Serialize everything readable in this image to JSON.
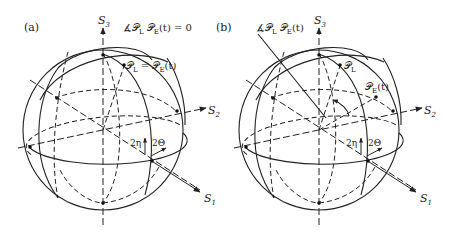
{
  "figure": {
    "panels": [
      {
        "label": "(a)",
        "axes": {
          "s1": "S",
          "s1_sub": "1",
          "s2": "S",
          "s2_sub": "2",
          "s3": "S",
          "s3_sub": "3"
        },
        "annotation": {
          "prefix": "∡𝒫",
          "sub1": "L",
          "mid": " 𝒫",
          "sub2": "E",
          "suffix": "(t) = 0"
        },
        "point_label": {
          "p1": "𝒫",
          "p1_sub": "L",
          "eq": " = 𝒫",
          "p2_sub": "E",
          "suffix": "(t)"
        },
        "angle_eta": "2η",
        "angle_theta": "2Θ"
      },
      {
        "label": "(b)",
        "axes": {
          "s1": "S",
          "s1_sub": "1",
          "s2": "S",
          "s2_sub": "2",
          "s3": "S",
          "s3_sub": "3"
        },
        "annotation": {
          "prefix": "∡𝒫",
          "sub1": "L",
          "mid": " 𝒫",
          "sub2": "E",
          "suffix": "(t)"
        },
        "point_pl": {
          "p": "𝒫",
          "sub": "L"
        },
        "point_pe": {
          "p": "𝒫",
          "sub": "E",
          "suffix": "(t)"
        },
        "angle_eta": "2η",
        "angle_theta": "2Θ"
      }
    ]
  }
}
